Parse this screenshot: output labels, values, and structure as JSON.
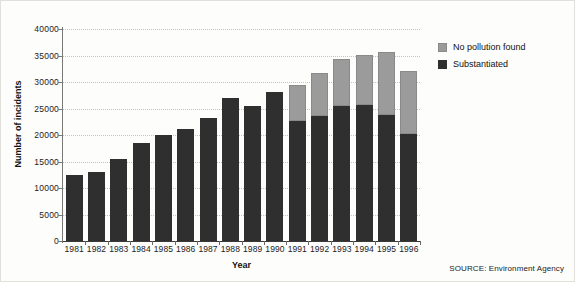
{
  "chart_data": {
    "type": "bar",
    "stacked": true,
    "title": "",
    "xlabel": "Year",
    "ylabel": "Number of incidents",
    "ylim": [
      0,
      40000
    ],
    "ytick_step": 5000,
    "yticks": [
      "0",
      "5000",
      "10000",
      "15000",
      "20000",
      "25000",
      "30000",
      "35000",
      "40000"
    ],
    "grid": true,
    "legend_position": "right",
    "categories": [
      "1981",
      "1982",
      "1983",
      "1984",
      "1985",
      "1986",
      "1987",
      "1988",
      "1989",
      "1990",
      "1991",
      "1992",
      "1993",
      "1994",
      "1995",
      "1996"
    ],
    "series": [
      {
        "name": "Substantiated",
        "color": "#2f2f2f",
        "values": [
          12500,
          13000,
          15500,
          18500,
          20000,
          21200,
          23200,
          27000,
          25400,
          28100,
          22700,
          23500,
          25400,
          25600,
          23700,
          20200
        ]
      },
      {
        "name": "No pollution found",
        "color": "#9b9b9b",
        "values": [
          0,
          0,
          0,
          0,
          0,
          0,
          0,
          0,
          0,
          0,
          6700,
          8200,
          9000,
          9500,
          12000,
          11900
        ]
      }
    ],
    "totals": [
      12500,
      13000,
      15500,
      18500,
      20000,
      21200,
      23200,
      27000,
      25400,
      28100,
      29400,
      31700,
      34400,
      35100,
      35700,
      32100
    ],
    "source": "SOURCE: Environment Agency"
  },
  "legend": {
    "items": [
      {
        "label": "No pollution found",
        "color": "#9b9b9b"
      },
      {
        "label": "Substantiated",
        "color": "#2f2f2f"
      }
    ]
  },
  "axes": {
    "x_title": "Year",
    "y_title": "Number of incidents"
  },
  "footer": {
    "source": "SOURCE: Environment Agency"
  }
}
